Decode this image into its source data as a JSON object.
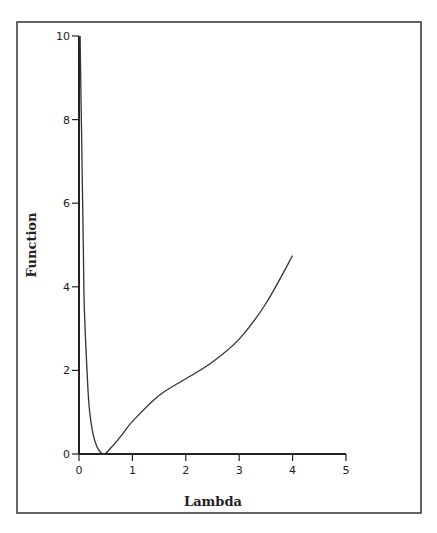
{
  "chart_data": {
    "type": "line",
    "title": "",
    "xlabel": "Lambda",
    "ylabel": "Function",
    "xlim": [
      0,
      5
    ],
    "ylim": [
      0,
      10
    ],
    "xticks": [
      0,
      1,
      2,
      3,
      4,
      5
    ],
    "yticks": [
      0,
      2,
      4,
      6,
      8,
      10
    ],
    "grid": false,
    "legend": null,
    "series": [
      {
        "name": "Function",
        "x": [
          0.02,
          0.05,
          0.08,
          0.1,
          0.15,
          0.2,
          0.3,
          0.45,
          0.6,
          0.8,
          1.0,
          1.5,
          2.0,
          2.5,
          3.0,
          3.5,
          4.0
        ],
        "y": [
          10.0,
          7.5,
          5.0,
          3.5,
          2.0,
          1.0,
          0.3,
          0.0,
          0.15,
          0.45,
          0.78,
          1.4,
          1.8,
          2.2,
          2.75,
          3.6,
          4.75
        ]
      }
    ]
  },
  "colors": {
    "line": "#333333",
    "axis": "#222222",
    "background": "#ffffff"
  }
}
